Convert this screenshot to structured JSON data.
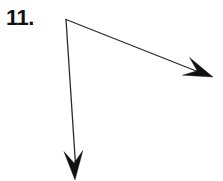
{
  "figure": {
    "label": "11.",
    "kind": "angle-diagram",
    "background_color": "#ffffff",
    "stroke_color": "#2b2b2b",
    "label_color": "#111111",
    "stroke_width": 1.3,
    "canvas": {
      "width": 223,
      "height": 181
    },
    "vertex": {
      "x": 66,
      "y": 19
    },
    "rays": [
      {
        "name": "ray-right",
        "direction": "down-right",
        "from": {
          "x": 66,
          "y": 19
        },
        "to": {
          "x": 213,
          "y": 77
        },
        "line_end": {
          "x": 196,
          "y": 70
        },
        "arrowhead": "barbed",
        "arrow_tip": {
          "x": 213,
          "y": 77
        }
      },
      {
        "name": "ray-down",
        "direction": "down",
        "from": {
          "x": 66,
          "y": 19
        },
        "to": {
          "x": 75,
          "y": 180
        },
        "line_end": {
          "x": 74,
          "y": 163
        },
        "arrowhead": "barbed",
        "arrow_tip": {
          "x": 75,
          "y": 180
        }
      }
    ]
  }
}
